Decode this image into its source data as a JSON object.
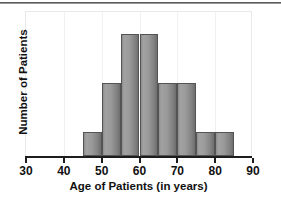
{
  "chart_data": {
    "type": "bar",
    "title": "",
    "subtitle": "",
    "xlabel": "Age of Patients (in years)",
    "ylabel": "Number of Patients",
    "xlim": [
      30,
      90
    ],
    "ylim": [
      0,
      6
    ],
    "grid": true,
    "legend": null,
    "bin_width": 5,
    "x_ticks": [
      30,
      40,
      50,
      60,
      70,
      80,
      90
    ],
    "x_tick_labels": [
      "30",
      "40",
      "50",
      "60",
      "70",
      "80",
      "90"
    ],
    "y_ticks": [],
    "y_tick_labels": [],
    "categories": [
      "45-50",
      "50-55",
      "55-60",
      "60-65",
      "65-70",
      "70-75",
      "75-80",
      "80-85"
    ],
    "bins": [
      {
        "start": 45,
        "end": 50,
        "value": 1
      },
      {
        "start": 50,
        "end": 55,
        "value": 3
      },
      {
        "start": 55,
        "end": 60,
        "value": 5
      },
      {
        "start": 60,
        "end": 65,
        "value": 5
      },
      {
        "start": 65,
        "end": 70,
        "value": 3
      },
      {
        "start": 70,
        "end": 75,
        "value": 3
      },
      {
        "start": 75,
        "end": 80,
        "value": 1
      },
      {
        "start": 80,
        "end": 85,
        "value": 1
      }
    ],
    "values": [
      1,
      3,
      5,
      5,
      3,
      3,
      1,
      1
    ],
    "colors": {
      "bar_fill": "#9a9a9a",
      "bar_edge": "#545454",
      "axis": "#1d1d1d",
      "grid": "#f1f1f1",
      "text": "#111111",
      "background": "#ffffff"
    }
  }
}
